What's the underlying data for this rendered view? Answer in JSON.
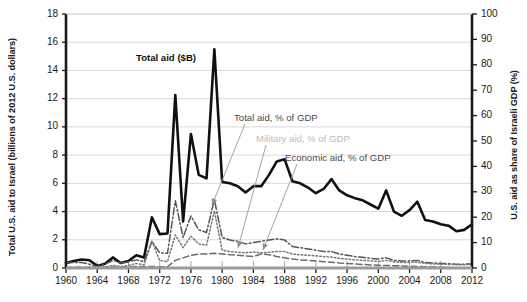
{
  "chart_data": {
    "type": "line",
    "title": "",
    "xlabel": "",
    "ylabel": "Total U.S. aid to Israel (billions of 2012 U.S. dollars)",
    "y2label": "U.S. aid as share of Israeli GDP (%)",
    "xlim": [
      1960,
      2012
    ],
    "ylim": [
      0,
      18
    ],
    "y2lim": [
      0,
      100
    ],
    "grid": true,
    "legend_position": "inline-annotations",
    "xticks": [
      1960,
      1964,
      1968,
      1972,
      1976,
      1980,
      1984,
      1988,
      1992,
      1996,
      2000,
      2004,
      2008,
      2012
    ],
    "yticks": [
      0,
      2,
      4,
      6,
      8,
      10,
      12,
      14,
      16,
      18
    ],
    "y2ticks": [
      0,
      10,
      20,
      30,
      40,
      50,
      60,
      70,
      80,
      90,
      100
    ],
    "x": [
      1960,
      1961,
      1962,
      1963,
      1964,
      1965,
      1966,
      1967,
      1968,
      1969,
      1970,
      1971,
      1972,
      1973,
      1974,
      1975,
      1976,
      1977,
      1978,
      1979,
      1980,
      1981,
      1982,
      1983,
      1984,
      1985,
      1986,
      1987,
      1988,
      1989,
      1990,
      1991,
      1992,
      1993,
      1994,
      1995,
      1996,
      1997,
      1998,
      1999,
      2000,
      2001,
      2002,
      2003,
      2004,
      2005,
      2006,
      2007,
      2008,
      2009,
      2010,
      2011,
      2012
    ],
    "series": [
      {
        "name": "Total aid ($B)",
        "axis": "left",
        "style": "solid",
        "color": "#111111",
        "values": [
          0.35,
          0.5,
          0.6,
          0.55,
          0.15,
          0.3,
          0.75,
          0.35,
          0.5,
          0.9,
          0.75,
          3.6,
          2.4,
          2.45,
          12.25,
          3.3,
          9.5,
          6.6,
          6.35,
          15.5,
          6.1,
          6.0,
          5.8,
          5.35,
          5.8,
          5.8,
          6.6,
          7.55,
          7.7,
          6.15,
          6.0,
          5.7,
          5.3,
          5.6,
          6.3,
          5.5,
          5.15,
          4.95,
          4.8,
          4.5,
          4.2,
          5.5,
          4.0,
          3.7,
          4.1,
          4.7,
          3.4,
          3.3,
          3.1,
          3.0,
          2.6,
          2.7,
          3.1
        ]
      },
      {
        "name": "Total aid, % of GDP",
        "axis": "right",
        "style": "dash-dot",
        "color": "#555555",
        "values": [
          2.0,
          2.2,
          2.2,
          1.5,
          0.6,
          1.5,
          3.0,
          2.0,
          2.5,
          3.2,
          2.5,
          10.5,
          6.0,
          5.8,
          26.5,
          12.0,
          20.5,
          15.0,
          14.0,
          27.0,
          12.0,
          11.0,
          10.5,
          9.5,
          10.0,
          10.5,
          11.0,
          11.5,
          11.0,
          8.5,
          8.0,
          7.5,
          7.0,
          6.5,
          6.5,
          5.5,
          5.0,
          4.5,
          4.2,
          3.8,
          3.5,
          4.0,
          3.0,
          2.8,
          2.8,
          3.0,
          2.2,
          2.0,
          1.8,
          1.7,
          1.5,
          1.5,
          1.6
        ]
      },
      {
        "name": "Military aid, % of GDP",
        "axis": "right",
        "style": "dotted",
        "color": "#777777",
        "values": [
          0.1,
          0.1,
          0.2,
          0.2,
          0.2,
          0.4,
          1.0,
          0.6,
          1.0,
          1.8,
          1.2,
          10.5,
          3.0,
          2.5,
          13.0,
          8.0,
          12.5,
          9.5,
          9.0,
          22.5,
          7.0,
          6.5,
          6.2,
          6.0,
          6.3,
          6.0,
          6.2,
          6.5,
          6.5,
          5.5,
          5.2,
          5.0,
          4.8,
          4.5,
          4.3,
          3.8,
          3.5,
          3.2,
          3.0,
          2.8,
          2.6,
          3.0,
          2.4,
          2.2,
          2.2,
          2.3,
          1.8,
          1.6,
          1.5,
          1.4,
          1.3,
          1.3,
          1.4
        ]
      },
      {
        "name": "Economic aid, % of GDP",
        "axis": "right",
        "style": "dashed",
        "color": "#6a6a6a",
        "values": [
          0.2,
          0.3,
          0.3,
          0.3,
          0.2,
          0.3,
          0.4,
          0.3,
          0.4,
          0.6,
          0.5,
          0.6,
          0.5,
          0.5,
          3.0,
          4.0,
          5.0,
          5.5,
          5.5,
          5.8,
          5.5,
          5.2,
          5.0,
          4.8,
          4.5,
          5.5,
          5.2,
          4.5,
          4.0,
          3.5,
          3.2,
          3.0,
          2.8,
          2.5,
          2.3,
          2.0,
          1.8,
          1.6,
          1.4,
          1.2,
          1.1,
          1.0,
          0.9,
          0.8,
          0.7,
          0.6,
          0.5,
          0.4,
          0.3,
          0.2,
          0.1,
          0.1,
          0.1
        ]
      }
    ],
    "annotations": [
      {
        "text": "Total aid ($B)",
        "emphasis": "bold"
      },
      {
        "text": "Total aid, % of GDP",
        "emphasis": "dark"
      },
      {
        "text": "Military aid, % of GDP",
        "emphasis": "light"
      },
      {
        "text": "Economic aid, % of GDP",
        "emphasis": "dark"
      }
    ]
  },
  "axes": {
    "left_title": "Total U.S. aid to Israel (billions of 2012 U.S. dollars)",
    "right_title": "U.S. aid as share of Israeli GDP (%)",
    "left_ticks": [
      "0",
      "2",
      "4",
      "6",
      "8",
      "10",
      "12",
      "14",
      "16",
      "18"
    ],
    "right_ticks": [
      "0",
      "10",
      "20",
      "30",
      "40",
      "50",
      "60",
      "70",
      "80",
      "90",
      "100"
    ],
    "x_ticks": [
      "1960",
      "1964",
      "1968",
      "1972",
      "1976",
      "1980",
      "1984",
      "1988",
      "1992",
      "1996",
      "2000",
      "2004",
      "2008",
      "2012"
    ]
  },
  "colors": {
    "total_aid": "#111111",
    "total_pct": "#555555",
    "military_pct": "#777777",
    "economic_pct": "#6a6a6a",
    "grid": "#d9d9d9",
    "axis": "#1a1a1a"
  }
}
